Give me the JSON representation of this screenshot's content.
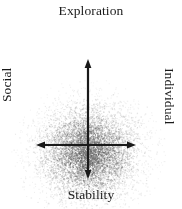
{
  "figure": {
    "background_color": "#ffffff"
  },
  "labels": {
    "top": "Exploration",
    "bottom": "Stability",
    "left": "Social",
    "right": "Individual"
  },
  "axes": {
    "vertical": {
      "name": "Exploration-Stability axis",
      "color": "#1a1a1a",
      "arrow_up": true,
      "arrow_down": true
    },
    "horizontal": {
      "name": "Social-Individual axis",
      "color": "#1a1a1a",
      "arrow_left": true,
      "arrow_right": true
    }
  },
  "chart_data": {
    "type": "scatter",
    "title": "Exploration",
    "xlabel": "Social — Individual",
    "ylabel": "Exploration — Stability",
    "axis_labels": {
      "top": "Exploration",
      "bottom": "Stability",
      "left": "Social",
      "right": "Individual"
    },
    "grid": false,
    "legend": false,
    "xlim": [
      -1,
      1
    ],
    "ylim": [
      -1,
      1
    ],
    "point_color": "#6b6b6b",
    "point_count": 7000,
    "distribution": "gaussian cloud, densest below and around the origin, fading radially outward",
    "center": [
      0.0,
      -0.12
    ],
    "spread": [
      0.42,
      0.4
    ],
    "quadrants": [
      {
        "name": "Social / Exploration",
        "position": "top-left"
      },
      {
        "name": "Individual / Exploration",
        "position": "top-right"
      },
      {
        "name": "Social / Stability",
        "position": "bottom-left"
      },
      {
        "name": "Individual / Stability",
        "position": "bottom-right"
      }
    ]
  }
}
